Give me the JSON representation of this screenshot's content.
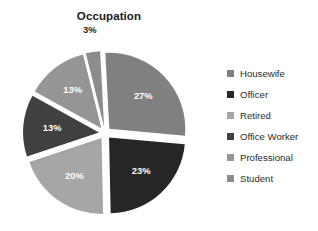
{
  "chart_data": {
    "type": "pie",
    "title": "Occupation",
    "xlabel": "",
    "ylabel": "",
    "unit": "%",
    "exploded": true,
    "start_angle_deg": -3,
    "legend_position": "right",
    "grid": false,
    "categories": [
      "Housewife",
      "Officer",
      "Retired",
      "Office Worker",
      "Professional",
      "Student"
    ],
    "values": [
      27,
      23,
      20,
      13,
      13,
      3
    ],
    "labels": [
      "27%",
      "23%",
      "20%",
      "13%",
      "13%",
      "3%"
    ],
    "label_positions": [
      "inside",
      "inside",
      "inside",
      "inside",
      "inside",
      "outside"
    ],
    "colors": [
      "#808080",
      "#262626",
      "#a6a6a6",
      "#404040",
      "#959595",
      "#8c8c8c"
    ],
    "label_colors": [
      "#ffffff",
      "#ffffff",
      "#ffffff",
      "#ffffff",
      "#ffffff",
      "#262626"
    ],
    "slices": [
      {
        "name": "Housewife",
        "value": 27,
        "label": "27%",
        "color": "#808080",
        "label_color": "#ffffff",
        "label_position": "inside"
      },
      {
        "name": "Officer",
        "value": 23,
        "label": "23%",
        "color": "#262626",
        "label_color": "#ffffff",
        "label_position": "inside"
      },
      {
        "name": "Retired",
        "value": 20,
        "label": "20%",
        "color": "#a6a6a6",
        "label_color": "#ffffff",
        "label_position": "inside"
      },
      {
        "name": "Office Worker",
        "value": 13,
        "label": "13%",
        "color": "#404040",
        "label_color": "#ffffff",
        "label_position": "inside"
      },
      {
        "name": "Professional",
        "value": 13,
        "label": "13%",
        "color": "#959595",
        "label_color": "#ffffff",
        "label_position": "inside"
      },
      {
        "name": "Student",
        "value": 3,
        "label": "3%",
        "color": "#8c8c8c",
        "label_color": "#262626",
        "label_position": "outside"
      }
    ]
  },
  "legend": {
    "items": [
      {
        "label": "Housewife",
        "color": "#808080"
      },
      {
        "label": "Officer",
        "color": "#262626"
      },
      {
        "label": "Retired",
        "color": "#a6a6a6"
      },
      {
        "label": "Office Worker",
        "color": "#404040"
      },
      {
        "label": "Professional",
        "color": "#959595"
      },
      {
        "label": "Student",
        "color": "#8c8c8c"
      }
    ]
  }
}
